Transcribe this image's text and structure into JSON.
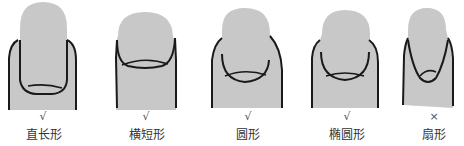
{
  "colors": {
    "fill": "#c8c8c8",
    "outline": "#1a1a1a",
    "background": "#ffffff"
  },
  "nails": [
    {
      "id": "straight-long",
      "label": "直长形",
      "mark": "√",
      "recommended": true
    },
    {
      "id": "horizontal-short",
      "label": "横短形",
      "mark": "√",
      "recommended": true
    },
    {
      "id": "round",
      "label": "圆形",
      "mark": "√",
      "recommended": true
    },
    {
      "id": "oval",
      "label": "椭圆形",
      "mark": "√",
      "recommended": true
    },
    {
      "id": "fan",
      "label": "扇形",
      "mark": "×",
      "recommended": false
    }
  ]
}
